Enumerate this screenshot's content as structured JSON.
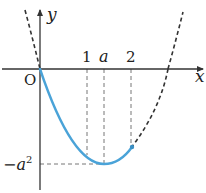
{
  "diagram": {
    "type": "coordinate-graph",
    "axes": {
      "x_label": "x",
      "y_label": "y",
      "origin_label": "O"
    },
    "x_ticks": [
      {
        "label": "1",
        "px": 87
      },
      {
        "label": "a",
        "px": 104
      },
      {
        "label": "2",
        "px": 131
      }
    ],
    "y_ticks": [
      {
        "label": "−a",
        "sup": "2",
        "py": 164
      }
    ],
    "curves": [
      {
        "name": "full-parabola",
        "style": "dashed",
        "color": "#333333"
      },
      {
        "name": "highlighted-arc",
        "style": "solid",
        "color": "#4aa3d8",
        "domain": "[0, 2]"
      }
    ],
    "colors": {
      "axis": "#333333",
      "highlight": "#4aa3d8",
      "guide": "#555555"
    }
  }
}
